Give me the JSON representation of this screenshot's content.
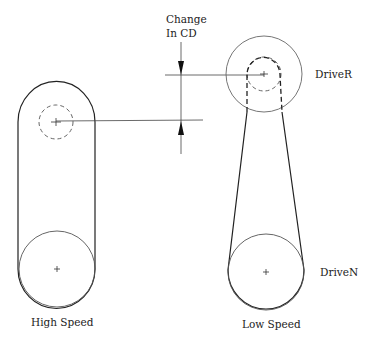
{
  "labels": {
    "change_line1": "Change",
    "change_line2": "In CD",
    "driver": "DriveR",
    "driven": "DriveN",
    "high_speed": "High Speed",
    "low_speed": "Low Speed"
  },
  "colors": {
    "belt": "#222222",
    "pulley": "#555555",
    "dashed": "#333333",
    "background": "#ffffff"
  }
}
